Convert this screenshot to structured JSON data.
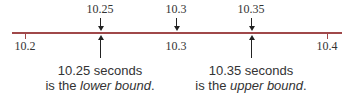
{
  "number_line": {
    "color": "#a0484a",
    "ticks": [
      {
        "label": "10.2",
        "x": 25
      },
      {
        "label": "10.3",
        "x": 176
      },
      {
        "label": "10.4",
        "x": 327
      }
    ],
    "marked_points": [
      {
        "label": "10.25",
        "x": 100
      },
      {
        "label": "10.3",
        "x": 176
      },
      {
        "label": "10.35",
        "x": 251
      }
    ]
  },
  "captions": {
    "lower": {
      "line1": "10.25 seconds",
      "prefix": "is the ",
      "emph": "lower bound",
      "suffix": "."
    },
    "upper": {
      "line1": "10.35 seconds",
      "prefix": "is the ",
      "emph": "upper bound",
      "suffix": "."
    }
  }
}
